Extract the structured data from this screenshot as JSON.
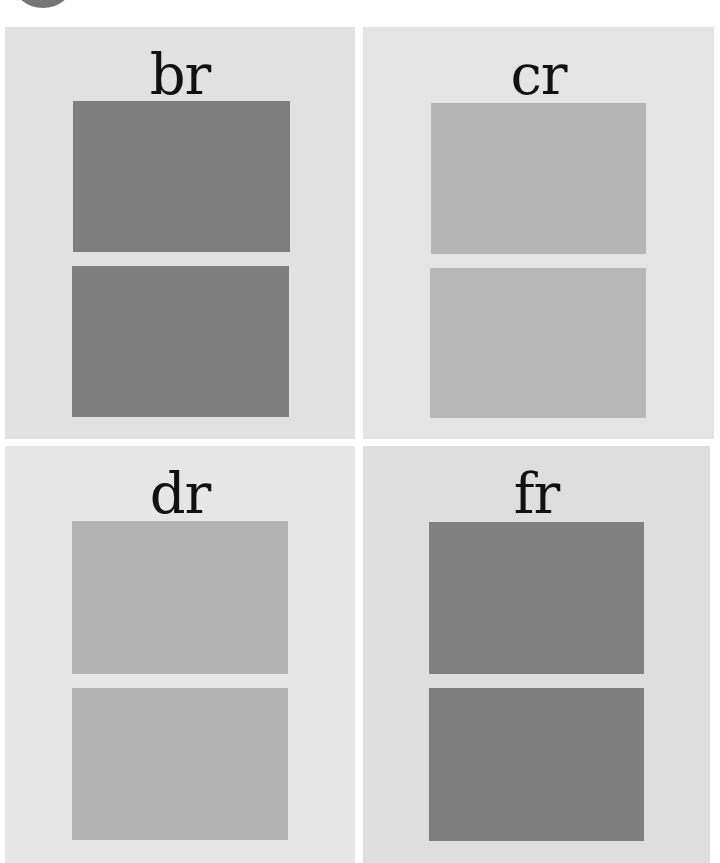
{
  "decoration": {
    "corner_circle_color": "#767676"
  },
  "panels": [
    {
      "id": "br",
      "label": "br",
      "background": "#e1e1e1",
      "rect": {
        "left": 5,
        "top": 27,
        "width": 350,
        "height": 412
      },
      "label_top": 20,
      "swatches": [
        {
          "color": "#7e7e7e",
          "rect": {
            "left": 68,
            "top": 74,
            "width": 217,
            "height": 151
          }
        },
        {
          "color": "#7f7f7f",
          "rect": {
            "left": 67,
            "top": 239,
            "width": 217,
            "height": 151
          }
        }
      ]
    },
    {
      "id": "cr",
      "label": "cr",
      "background": "#e4e4e4",
      "rect": {
        "left": 363,
        "top": 27,
        "width": 351,
        "height": 412
      },
      "label_top": 20,
      "swatches": [
        {
          "color": "#b5b5b5",
          "rect": {
            "left": 68,
            "top": 76,
            "width": 215,
            "height": 151
          }
        },
        {
          "color": "#b7b7b7",
          "rect": {
            "left": 67,
            "top": 241,
            "width": 216,
            "height": 150
          }
        }
      ]
    },
    {
      "id": "dr",
      "label": "dr",
      "background": "#e6e6e6",
      "rect": {
        "left": 5,
        "top": 446,
        "width": 350,
        "height": 417
      },
      "label_top": 20,
      "swatches": [
        {
          "color": "#b3b3b3",
          "rect": {
            "left": 67,
            "top": 75,
            "width": 216,
            "height": 153
          }
        },
        {
          "color": "#b3b3b3",
          "rect": {
            "left": 67,
            "top": 242,
            "width": 216,
            "height": 152
          }
        }
      ]
    },
    {
      "id": "fr",
      "label": "fr",
      "background": "#dedede",
      "rect": {
        "left": 363,
        "top": 446,
        "width": 347,
        "height": 417
      },
      "label_top": 20,
      "swatches": [
        {
          "color": "#808080",
          "rect": {
            "left": 66,
            "top": 76,
            "width": 215,
            "height": 152
          }
        },
        {
          "color": "#7f7f7f",
          "rect": {
            "left": 66,
            "top": 242,
            "width": 215,
            "height": 153
          }
        }
      ]
    }
  ]
}
